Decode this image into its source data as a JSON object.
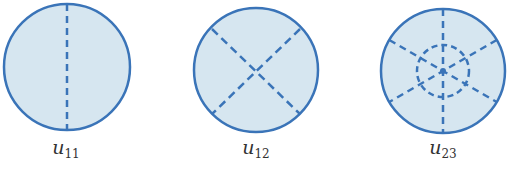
{
  "colors": {
    "fill": "#d6e6f0",
    "stroke": "#3a74b8",
    "label": "#333333",
    "background": "#ffffff"
  },
  "modes": [
    {
      "id": "u11",
      "label_base": "u",
      "label_sub": "11",
      "description": "Circular membrane mode with one nodal diameter",
      "nodal_diameters": 1,
      "nodal_circles": 0,
      "center": [
        67,
        67
      ],
      "radius": 63
    },
    {
      "id": "u12",
      "label_base": "u",
      "label_sub": "12",
      "description": "Circular membrane mode with two nodal diameters",
      "nodal_diameters": 2,
      "nodal_circles": 0,
      "center": [
        256,
        70
      ],
      "radius": 62
    },
    {
      "id": "u23",
      "label_base": "u",
      "label_sub": "23",
      "description": "Circular membrane mode with three nodal diameters and one nodal circle",
      "nodal_diameters": 3,
      "nodal_circles": 1,
      "center": [
        443,
        71
      ],
      "radius": 62
    }
  ]
}
